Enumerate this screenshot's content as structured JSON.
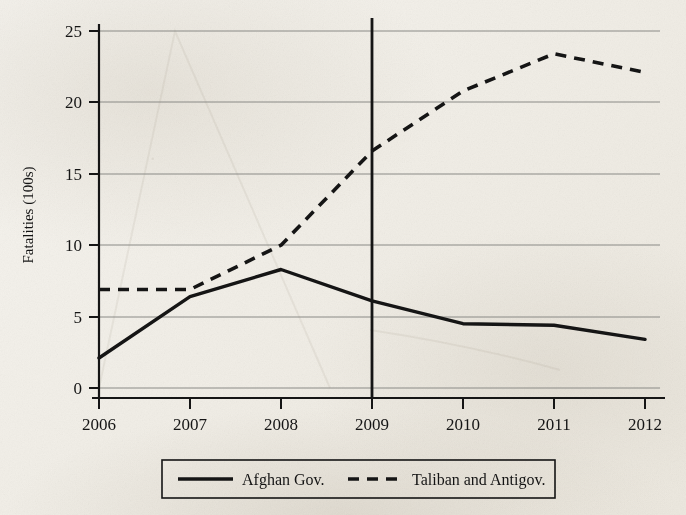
{
  "figure": {
    "background_color": "#f1eee7",
    "ink_color": "#151515",
    "gridline_color": "#8a8a86"
  },
  "axes": {
    "y_axis_title": "Fatalities (100s)",
    "y_ticks": [
      "0",
      "5",
      "10",
      "15",
      "20",
      "25"
    ],
    "x_ticks": [
      "2006",
      "2007",
      "2008",
      "2009",
      "2010",
      "2011",
      "2012"
    ]
  },
  "legend": {
    "entries": [
      {
        "label": "Afghan Gov.",
        "style": "solid"
      },
      {
        "label": "Taliban and Antigov.",
        "style": "dashed"
      }
    ]
  },
  "annotations": {
    "vertical_rule_year": "2009"
  },
  "chart_data": {
    "type": "line",
    "title": "",
    "xlabel": "",
    "ylabel": "Fatalities (100s)",
    "x": [
      2006,
      2007,
      2008,
      2009,
      2010,
      2011,
      2012
    ],
    "xtick_labels": [
      "2006",
      "2007",
      "2008",
      "2009",
      "2010",
      "2011",
      "2012"
    ],
    "ytick_labels": [
      "0",
      "5",
      "10",
      "15",
      "20",
      "25"
    ],
    "xlim": [
      2006,
      2012
    ],
    "ylim": [
      0,
      25
    ],
    "grid": true,
    "legend_position": "below-axes",
    "series": [
      {
        "name": "Afghan Gov.",
        "style": "solid",
        "color": "#151515",
        "values": [
          2.1,
          6.4,
          8.3,
          6.1,
          4.5,
          4.4,
          3.4
        ]
      },
      {
        "name": "Taliban and Antigov.",
        "style": "dashed",
        "color": "#151515",
        "values": [
          6.9,
          6.9,
          10.0,
          16.6,
          20.8,
          23.4,
          22.1
        ]
      }
    ],
    "annotations": [
      {
        "type": "vertical-line",
        "x": 2009,
        "label": "2009",
        "color": "#151515"
      }
    ]
  }
}
